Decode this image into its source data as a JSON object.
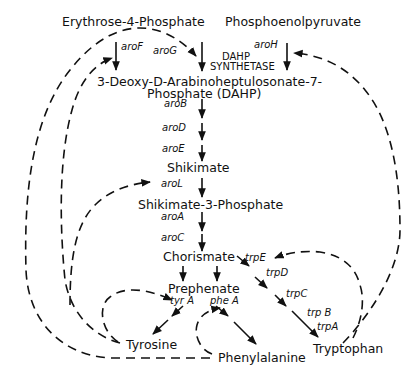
{
  "diagram": {
    "compounds": {
      "e4p": "Erythrose-4-Phosphate",
      "pep": "Phosphoenolpyruvate",
      "dahp_line1": "3-Deoxy-D-Arabinoheptulosonate-7-",
      "dahp_line2": "Phosphate (DAHP)",
      "shikimate": "Shikimate",
      "s3p": "Shikimate-3-Phosphate",
      "chorismate": "Chorismate",
      "prephenate": "Prephenate",
      "tyrosine": "Tyrosine",
      "phenylalanine": "Phenylalanine",
      "tryptophan": "Tryptophan"
    },
    "enzyme": {
      "line1": "DAHP",
      "line2": "SYNTHETASE"
    },
    "genes": {
      "aroF": "aroF",
      "aroG": "aroG",
      "aroH": "aroH",
      "aroB": "aroB",
      "aroD": "aroD",
      "aroE": "aroE",
      "aroL": "aroL",
      "aroA": "aroA",
      "aroC": "aroC",
      "trpE": "trpE",
      "trpD": "trpD",
      "trpC": "trpC",
      "trpB": "trp B",
      "trpA": "trpA",
      "tyrA": "tyr A",
      "pheA": "phe A"
    },
    "edges": {
      "solid": [
        {
          "from": "E4P + PEP",
          "to": "DAHP",
          "via": [
            "aroF",
            "aroG",
            "aroH"
          ]
        },
        {
          "from": "DAHP",
          "to": "Shikimate",
          "via": [
            "aroB",
            "aroD",
            "aroE"
          ]
        },
        {
          "from": "Shikimate",
          "to": "Shikimate-3-Phosphate",
          "via": [
            "aroL"
          ]
        },
        {
          "from": "Shikimate-3-Phosphate",
          "to": "Chorismate",
          "via": [
            "aroA",
            "aroC"
          ]
        },
        {
          "from": "Chorismate",
          "to": "Prephenate"
        },
        {
          "from": "Prephenate",
          "to": "Tyrosine",
          "via": [
            "tyrA"
          ]
        },
        {
          "from": "Prephenate",
          "to": "Phenylalanine",
          "via": [
            "pheA"
          ]
        },
        {
          "from": "Chorismate",
          "to": "Tryptophan",
          "via": [
            "trpE",
            "trpD",
            "trpC",
            "trpB",
            "trpA"
          ]
        }
      ],
      "dashed_regulation": [
        {
          "from": "Phenylalanine",
          "to": "aroG"
        },
        {
          "from": "Tyrosine",
          "to": "aroF"
        },
        {
          "from": "Tryptophan",
          "to": "aroH"
        },
        {
          "from": "Tyrosine",
          "to": "aroL"
        },
        {
          "from": "Tyrosine",
          "to": "tyrA"
        },
        {
          "from": "Phenylalanine",
          "to": "pheA"
        },
        {
          "from": "Tryptophan",
          "to": "trpE"
        }
      ]
    }
  }
}
